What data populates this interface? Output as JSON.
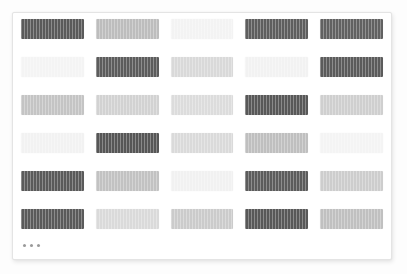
{
  "page": {
    "background_color": "#fdfdfd"
  },
  "card": {
    "name": "placeholder-card",
    "background_color": "#ffffff",
    "border_color": "#e4e4e4"
  },
  "palette": {
    "dark": "#5a5a5a",
    "mid": "#b5b5b5",
    "mid_light": "#c9c9c9",
    "light": "#dcdcdc",
    "very_light": "#f3f3f3"
  },
  "grid": {
    "columns": 5,
    "rows": 6,
    "cell_count": 30,
    "rows_data": [
      {
        "index": 1,
        "cells": [
          {
            "shade": "dark",
            "color": "#5a5a5a"
          },
          {
            "shade": "mid",
            "color": "#bdbdbd"
          },
          {
            "shade": "very_light",
            "color": "#f3f3f3"
          },
          {
            "shade": "dark",
            "color": "#5e5e5e"
          },
          {
            "shade": "dark",
            "color": "#616161"
          }
        ]
      },
      {
        "index": 2,
        "cells": [
          {
            "shade": "very_light",
            "color": "#f4f4f4"
          },
          {
            "shade": "dark",
            "color": "#5c5c5c"
          },
          {
            "shade": "light",
            "color": "#d9d9d9"
          },
          {
            "shade": "very_light",
            "color": "#f2f2f2"
          },
          {
            "shade": "dark",
            "color": "#5b5b5b"
          }
        ]
      },
      {
        "index": 3,
        "cells": [
          {
            "shade": "mid",
            "color": "#c4c4c4"
          },
          {
            "shade": "mid_light",
            "color": "#d2d2d2"
          },
          {
            "shade": "light",
            "color": "#dcdcdc"
          },
          {
            "shade": "dark",
            "color": "#585858"
          },
          {
            "shade": "mid_light",
            "color": "#cfcfcf"
          }
        ]
      },
      {
        "index": 4,
        "cells": [
          {
            "shade": "very_light",
            "color": "#f2f2f2"
          },
          {
            "shade": "dark",
            "color": "#565656"
          },
          {
            "shade": "light",
            "color": "#dadada"
          },
          {
            "shade": "mid",
            "color": "#bfbfbf"
          },
          {
            "shade": "very_light",
            "color": "#f4f4f4"
          }
        ]
      },
      {
        "index": 5,
        "cells": [
          {
            "shade": "dark",
            "color": "#5a5a5a"
          },
          {
            "shade": "mid",
            "color": "#c2c2c2"
          },
          {
            "shade": "very_light",
            "color": "#f1f1f1"
          },
          {
            "shade": "dark",
            "color": "#5c5c5c"
          },
          {
            "shade": "mid_light",
            "color": "#cdcdcd"
          }
        ]
      },
      {
        "index": 6,
        "cells": [
          {
            "shade": "dark",
            "color": "#5a5a5a"
          },
          {
            "shade": "light",
            "color": "#dadada"
          },
          {
            "shade": "mid_light",
            "color": "#cbcbcb"
          },
          {
            "shade": "dark",
            "color": "#585858"
          },
          {
            "shade": "mid",
            "color": "#c0c0c0"
          }
        ]
      }
    ]
  },
  "more_indicator": {
    "label": "...",
    "dot_count": 3,
    "dot_color": "#9a9a9a"
  }
}
